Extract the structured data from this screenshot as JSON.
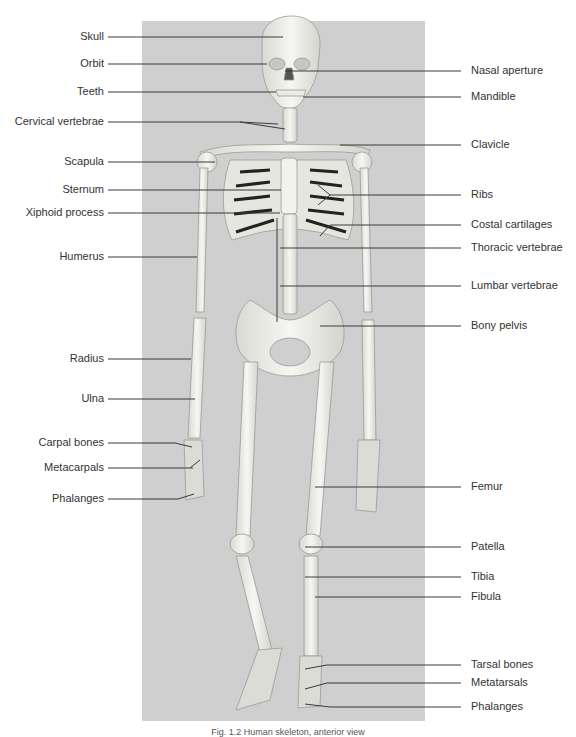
{
  "figure": {
    "title": "Human skeleton, anterior view",
    "panel_color": "#cfcfcf",
    "leader_color": "#3a3a3a",
    "caption": "Fig. 1.2  Human skeleton, anterior view"
  },
  "labels_left": [
    {
      "text": "Skull",
      "y": 37,
      "x2": 283
    },
    {
      "text": "Orbit",
      "y": 64,
      "x2": 267
    },
    {
      "text": "Teeth",
      "y": 92,
      "x2": 276
    },
    {
      "text": "Cervical vertebrae",
      "y": 122,
      "x2": 280
    },
    {
      "text": "Scapula",
      "y": 162,
      "x2": 215
    },
    {
      "text": "Sternum",
      "y": 190,
      "x2": 281
    },
    {
      "text": "Xiphoid process",
      "y": 213,
      "x2": 280
    },
    {
      "text": "Humerus",
      "y": 257,
      "x2": 197
    },
    {
      "text": "Radius",
      "y": 359,
      "x2": 191
    },
    {
      "text": "Ulna",
      "y": 399,
      "x2": 195
    },
    {
      "text": "Carpal bones",
      "y": 443,
      "x2": 190
    },
    {
      "text": "Metacarpals",
      "y": 468,
      "x2": 193
    },
    {
      "text": "Phalanges",
      "y": 499,
      "x2": 190
    }
  ],
  "labels_right": [
    {
      "text": "Nasal aperture",
      "y": 71,
      "x1": 285
    },
    {
      "text": "Mandible",
      "y": 97,
      "x1": 303
    },
    {
      "text": "Clavicle",
      "y": 145,
      "x1": 340
    },
    {
      "text": "Ribs",
      "y": 195,
      "x1": 330
    },
    {
      "text": "Costal cartilages",
      "y": 225,
      "x1": 330
    },
    {
      "text": "Thoracic vertebrae",
      "y": 248,
      "x1": 280
    },
    {
      "text": "Lumbar vertebrae",
      "y": 286,
      "x1": 280
    },
    {
      "text": "Bony pelvis",
      "y": 326,
      "x1": 320
    },
    {
      "text": "Femur",
      "y": 487,
      "x1": 315
    },
    {
      "text": "Patella",
      "y": 547,
      "x1": 305
    },
    {
      "text": "Tibia",
      "y": 577,
      "x1": 305
    },
    {
      "text": "Fibula",
      "y": 597,
      "x1": 315
    },
    {
      "text": "Tarsal bones",
      "y": 665,
      "x1": 305
    },
    {
      "text": "Metatarsals",
      "y": 683,
      "x1": 305
    },
    {
      "text": "Phalanges",
      "y": 707,
      "x1": 305
    }
  ]
}
